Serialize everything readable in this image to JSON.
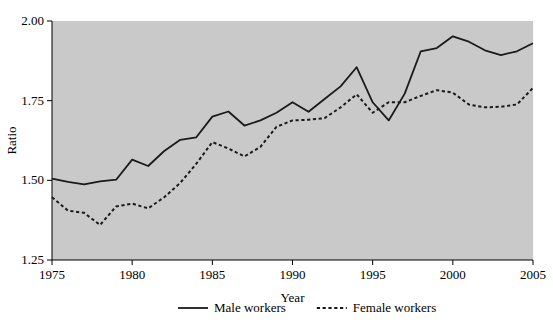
{
  "chart_data": {
    "type": "line",
    "title": "",
    "xlabel": "Year",
    "ylabel": "Ratio",
    "xlim": [
      1975,
      2005
    ],
    "ylim": [
      1.25,
      2.0
    ],
    "grid": false,
    "legend_position": "bottom-center",
    "plot_background": "#c9c9c9",
    "line_color": "#1a1a1a",
    "x": [
      1975,
      1976,
      1977,
      1978,
      1979,
      1980,
      1981,
      1982,
      1983,
      1984,
      1985,
      1986,
      1987,
      1988,
      1989,
      1990,
      1991,
      1992,
      1993,
      1994,
      1995,
      1996,
      1997,
      1998,
      1999,
      2000,
      2001,
      2002,
      2003,
      2004,
      2005
    ],
    "xticks": [
      1975,
      1980,
      1985,
      1990,
      1995,
      2000,
      2005
    ],
    "xticklabels": [
      "1975",
      "1980",
      "1985",
      "1990",
      "1995",
      "2000",
      "2005"
    ],
    "yticks": [
      1.25,
      1.5,
      1.75,
      2.0
    ],
    "yticklabels": [
      "1.25",
      "1.50",
      "1.75",
      "2.00"
    ],
    "series": [
      {
        "name": "Male workers",
        "style": "solid",
        "values": [
          1.505,
          1.495,
          1.487,
          1.497,
          1.502,
          1.565,
          1.545,
          1.592,
          1.627,
          1.635,
          1.7,
          1.716,
          1.672,
          1.688,
          1.712,
          1.745,
          1.715,
          1.755,
          1.795,
          1.855,
          1.745,
          1.688,
          1.772,
          1.905,
          1.915,
          1.952,
          1.935,
          1.908,
          1.893,
          1.905,
          1.93
        ]
      },
      {
        "name": "Female workers",
        "style": "dotted",
        "values": [
          1.447,
          1.405,
          1.398,
          1.36,
          1.418,
          1.427,
          1.412,
          1.447,
          1.492,
          1.552,
          1.62,
          1.6,
          1.575,
          1.605,
          1.668,
          1.688,
          1.69,
          1.695,
          1.729,
          1.77,
          1.712,
          1.745,
          1.745,
          1.765,
          1.783,
          1.775,
          1.738,
          1.729,
          1.731,
          1.738,
          1.79
        ]
      }
    ]
  },
  "legend": {
    "items": [
      {
        "label": "Male workers",
        "style": "solid"
      },
      {
        "label": "Female workers",
        "style": "dotted"
      }
    ]
  }
}
